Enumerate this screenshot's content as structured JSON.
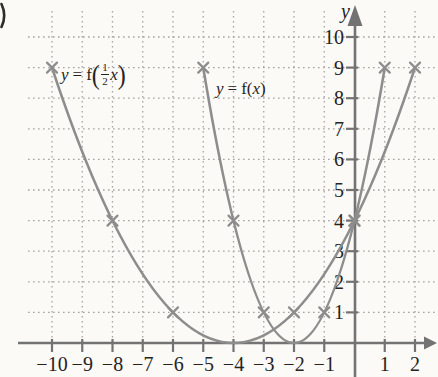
{
  "y_axis_title": "y",
  "chart_data": {
    "type": "line",
    "x_axis": {
      "label": "",
      "range_shown": [
        -10,
        2
      ],
      "arrow": "right",
      "ticks": [
        {
          "value": -10,
          "label": "−10"
        },
        {
          "value": -9,
          "label": "−9"
        },
        {
          "value": -8,
          "label": "−8"
        },
        {
          "value": -7,
          "label": "−7"
        },
        {
          "value": -6,
          "label": "−6"
        },
        {
          "value": -5,
          "label": "−5"
        },
        {
          "value": -4,
          "label": "−4"
        },
        {
          "value": -3,
          "label": "−3"
        },
        {
          "value": -2,
          "label": "−2"
        },
        {
          "value": -1,
          "label": "−1"
        },
        {
          "value": 1,
          "label": "1"
        },
        {
          "value": 2,
          "label": "2"
        }
      ]
    },
    "y_axis": {
      "label": "y",
      "range_shown": [
        0,
        10
      ],
      "arrow": "up",
      "ticks": [
        {
          "value": 1,
          "label": "1"
        },
        {
          "value": 2,
          "label": "2"
        },
        {
          "value": 3,
          "label": "3"
        },
        {
          "value": 4,
          "label": "4"
        },
        {
          "value": 5,
          "label": "5"
        },
        {
          "value": 6,
          "label": "6"
        },
        {
          "value": 7,
          "label": "7"
        },
        {
          "value": 8,
          "label": "8"
        },
        {
          "value": 9,
          "label": "9"
        },
        {
          "value": 10,
          "label": "10"
        }
      ]
    },
    "series": [
      {
        "name": "y = f(x)",
        "equation": "y = (x+2)^2",
        "vertex": [
          -2,
          0
        ],
        "x_domain": [
          -5,
          1
        ],
        "bezier": {
          "start": [
            -5,
            9
          ],
          "control": [
            -2,
            -9
          ],
          "end": [
            1,
            9
          ]
        },
        "marked_points": [
          [
            -5,
            9
          ],
          [
            -4,
            4
          ],
          [
            -3,
            1
          ],
          [
            -1,
            1
          ],
          [
            0,
            4
          ],
          [
            1,
            9
          ]
        ]
      },
      {
        "name": "y = f(1/2 x)",
        "equation": "y = (x/2+2)^2",
        "vertex": [
          -4,
          0
        ],
        "x_domain": [
          -10,
          2
        ],
        "bezier": {
          "start": [
            -10,
            9
          ],
          "control": [
            -4,
            -9
          ],
          "end": [
            2,
            9
          ]
        },
        "marked_points": [
          [
            -10,
            9
          ],
          [
            -8,
            4
          ],
          [
            -6,
            1
          ],
          [
            -2,
            1
          ],
          [
            0,
            4
          ],
          [
            2,
            9
          ]
        ]
      }
    ],
    "grid": "dotted, every 1 unit both axes",
    "colors": {
      "curve": "#8d8d8d",
      "axis": "#737373",
      "grid": "#a4a4a4",
      "text": "#26231f",
      "background": "#fbfaf6"
    }
  },
  "labels": {
    "fx": {
      "y": "y",
      "eq": "=",
      "fn": "f(",
      "arg": "x",
      "close": ")"
    },
    "fhalf": {
      "y": "y",
      "eq": "=",
      "f": "f",
      "open": "(",
      "num": "1",
      "den": "2",
      "arg": "x",
      "close": ")"
    }
  }
}
